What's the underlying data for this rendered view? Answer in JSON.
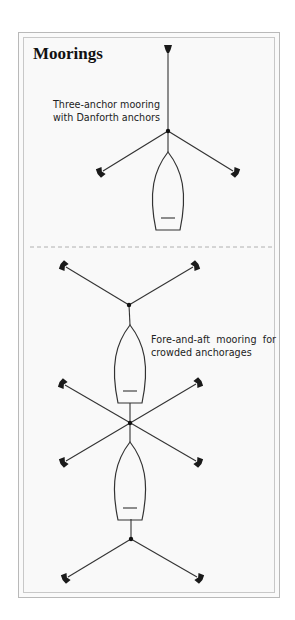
{
  "title": "Moorings",
  "captions": {
    "three_anchor": [
      "Three-anchor mooring",
      "with Danforth anchors"
    ],
    "fore_and_aft": [
      "Fore-and-aft  mooring  for",
      "crowded anchorages"
    ]
  },
  "colors": {
    "line": "#333333",
    "anchor": "#1a1a1a",
    "divider": "#b0b0b0",
    "frame": "#b9b9b9",
    "background": "#f9f9f9"
  },
  "diagrams": [
    {
      "name": "three-anchor-mooring",
      "hub": [
        168,
        131
      ],
      "anchors": [
        [
          168,
          48
        ],
        [
          101,
          172
        ],
        [
          235,
          172
        ]
      ],
      "boats": [
        {
          "bow": [
            168,
            152
          ],
          "stern_y": 230
        }
      ]
    },
    {
      "name": "fore-and-aft-mooring",
      "hubs": [
        [
          129,
          305
        ],
        [
          130,
          423
        ],
        [
          131,
          539
        ]
      ],
      "anchors": [
        [
          64,
          266
        ],
        [
          195,
          266
        ],
        [
          63,
          384
        ],
        [
          198,
          383
        ],
        [
          64,
          462
        ],
        [
          198,
          462
        ],
        [
          66,
          578
        ],
        [
          199,
          578
        ]
      ],
      "boats": [
        {
          "bow": [
            130,
            325
          ],
          "stern_y": 403
        },
        {
          "bow": [
            130,
            442
          ],
          "stern_y": 519
        }
      ]
    }
  ]
}
